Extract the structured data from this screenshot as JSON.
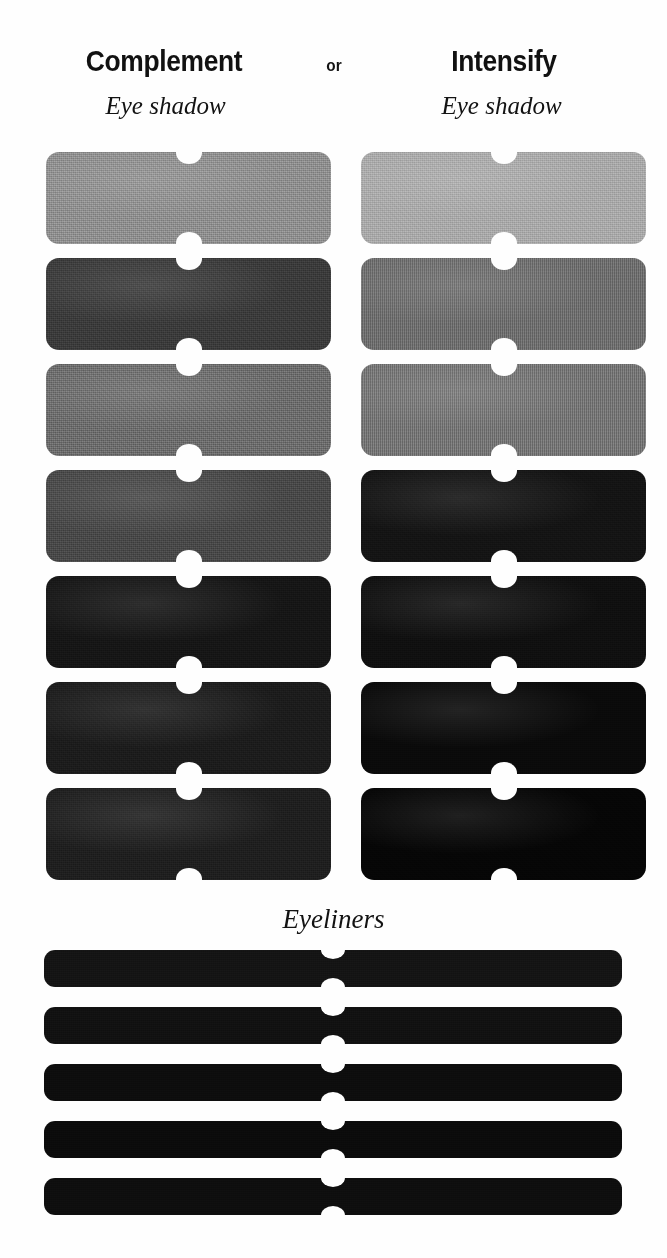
{
  "page": {
    "background_color": "#fefefe",
    "kind": "cosmetics-palette-swatch-chart"
  },
  "header": {
    "left_title": "Complement",
    "conjunction": "or",
    "right_title": "Intensify",
    "left_subtitle": "Eye shadow",
    "right_subtitle": "Eye shadow"
  },
  "sections": {
    "eyeliners_title": "Eyeliners"
  },
  "columns": [
    {
      "name": "complement",
      "title": "Complement",
      "subtitle": "Eye shadow",
      "swatches": [
        {
          "index": 1,
          "color": "#8f8f8f",
          "texture": "matte-granular"
        },
        {
          "index": 2,
          "color": "#3b3b3b",
          "texture": "matte-granular"
        },
        {
          "index": 3,
          "color": "#6d6d6d",
          "texture": "matte-granular"
        },
        {
          "index": 4,
          "color": "#494949",
          "texture": "matte-granular"
        },
        {
          "index": 5,
          "color": "#161616",
          "texture": "matte-granular"
        },
        {
          "index": 6,
          "color": "#1c1c1c",
          "texture": "matte-granular"
        },
        {
          "index": 7,
          "color": "#1f1f1f",
          "texture": "matte-granular"
        }
      ]
    },
    {
      "name": "intensify",
      "title": "Intensify",
      "subtitle": "Eye shadow",
      "swatches": [
        {
          "index": 1,
          "color": "#a9a9a9",
          "texture": "matte-granular"
        },
        {
          "index": 2,
          "color": "#6f6f6f",
          "texture": "vertical-striated"
        },
        {
          "index": 3,
          "color": "#767676",
          "texture": "vertical-striated"
        },
        {
          "index": 4,
          "color": "#141414",
          "texture": "matte-granular"
        },
        {
          "index": 5,
          "color": "#101010",
          "texture": "matte-granular"
        },
        {
          "index": 6,
          "color": "#0a0a0a",
          "texture": "matte-granular"
        },
        {
          "index": 7,
          "color": "#060606",
          "texture": "matte-granular"
        }
      ]
    }
  ],
  "eyeliners": {
    "title": "Eyeliners",
    "bars": [
      {
        "index": 1,
        "color": "#141414",
        "texture": "matte-granular"
      },
      {
        "index": 2,
        "color": "#111111",
        "texture": "matte-granular"
      },
      {
        "index": 3,
        "color": "#0d0d0d",
        "texture": "matte-granular"
      },
      {
        "index": 4,
        "color": "#0b0b0b",
        "texture": "matte-granular"
      },
      {
        "index": 5,
        "color": "#0e0e0e",
        "texture": "matte-granular"
      }
    ]
  }
}
